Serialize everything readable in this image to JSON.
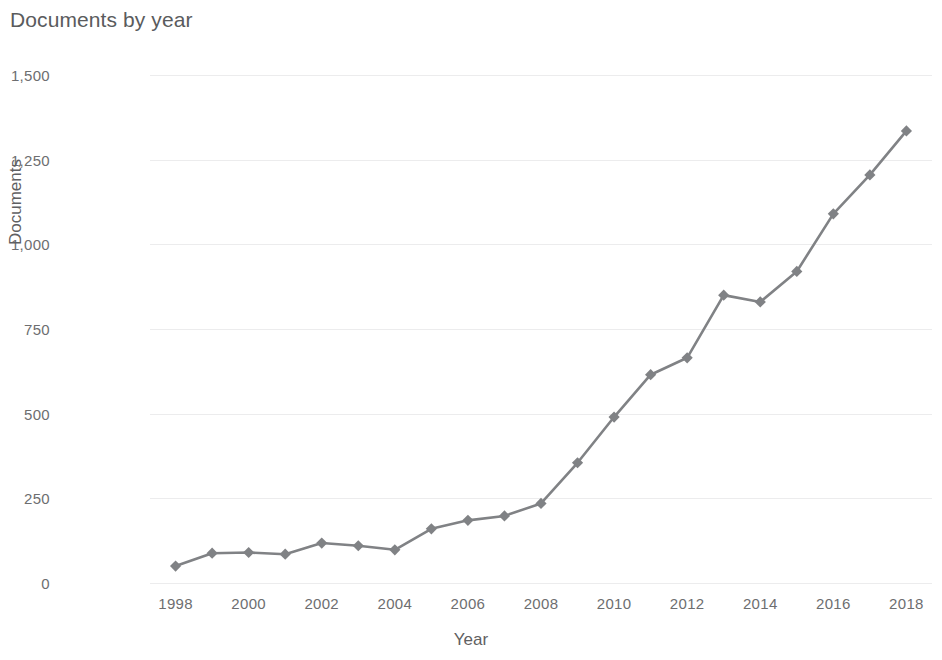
{
  "chart_data": {
    "type": "line",
    "title": "Documents by year",
    "xlabel": "Year",
    "ylabel": "Documents",
    "grid": true,
    "legend": false,
    "marker": "diamond",
    "series_color": "#808285",
    "grid_color": "#ececed",
    "text_color": "#6d6e70",
    "xlim": [
      1997.3,
      2018.7
    ],
    "ylim": [
      0,
      1500
    ],
    "ytick_values": [
      0,
      250,
      500,
      750,
      1000,
      1250,
      1500
    ],
    "ytick_labels": [
      "0",
      "250",
      "500",
      "750",
      "1,000",
      "1,250",
      "1,500"
    ],
    "xtick_values": [
      1998,
      2000,
      2002,
      2004,
      2006,
      2008,
      2010,
      2012,
      2014,
      2016,
      2018
    ],
    "xtick_labels": [
      "1998",
      "2000",
      "2002",
      "2004",
      "2006",
      "2008",
      "2010",
      "2012",
      "2014",
      "2016",
      "2018"
    ],
    "x": [
      1998,
      1999,
      2000,
      2001,
      2002,
      2003,
      2004,
      2005,
      2006,
      2007,
      2008,
      2009,
      2010,
      2011,
      2012,
      2013,
      2014,
      2015,
      2016,
      2017,
      2018
    ],
    "values": [
      50,
      88,
      90,
      85,
      118,
      110,
      98,
      160,
      185,
      198,
      235,
      355,
      490,
      615,
      665,
      850,
      830,
      920,
      1090,
      1205,
      1335
    ],
    "series": [
      {
        "name": "Documents",
        "values": [
          50,
          88,
          90,
          85,
          118,
          110,
          98,
          160,
          185,
          198,
          235,
          355,
          490,
          615,
          665,
          850,
          830,
          920,
          1090,
          1205,
          1335
        ]
      }
    ]
  }
}
